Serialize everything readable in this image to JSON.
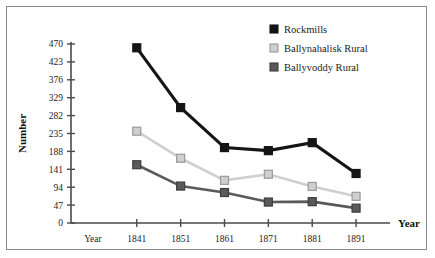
{
  "figure": {
    "frame_border_color": "#8a8a8a",
    "background_color": "#ffffff"
  },
  "chart_data": {
    "type": "line",
    "title": "",
    "xlabel": "Year",
    "ylabel": "Number",
    "categories": [
      "Year",
      "1841",
      "1851",
      "1861",
      "1871",
      "1881",
      "1891"
    ],
    "x_tick_labels": [
      "Year",
      "1841",
      "1851",
      "1861",
      "1871",
      "1881",
      "1891"
    ],
    "y_tick_labels": [
      "0",
      "47",
      "94",
      "141",
      "188",
      "235",
      "282",
      "329",
      "376",
      "423",
      "470"
    ],
    "y_ticks": [
      0,
      47,
      94,
      141,
      188,
      235,
      282,
      329,
      376,
      423,
      470
    ],
    "ylim": [
      0,
      470
    ],
    "grid": false,
    "legend_position": "top-right",
    "marker": "square",
    "series": [
      {
        "name": "Rockmills",
        "color": "#151515",
        "marker_fill": "#151515",
        "marker_edge": "#151515",
        "x": [
          "1841",
          "1851",
          "1861",
          "1871",
          "1881",
          "1891"
        ],
        "values": [
          460,
          303,
          198,
          190,
          211,
          130
        ]
      },
      {
        "name": "Ballynahalisk Rural",
        "color": "#cfcfcf",
        "marker_fill": "#cfcfcf",
        "marker_edge": "#9a9a9a",
        "x": [
          "1841",
          "1851",
          "1861",
          "1871",
          "1881",
          "1891"
        ],
        "values": [
          241,
          170,
          112,
          128,
          96,
          70
        ]
      },
      {
        "name": "Ballyvoddy Rural",
        "color": "#5a5a5a",
        "marker_fill": "#5a5a5a",
        "marker_edge": "#3d3d3d",
        "x": [
          "1841",
          "1851",
          "1861",
          "1871",
          "1881",
          "1891"
        ],
        "values": [
          153,
          97,
          80,
          55,
          56,
          39
        ]
      }
    ],
    "legend": [
      {
        "label": "Rockmills",
        "color": "#151515",
        "edge": "#151515"
      },
      {
        "label": "Ballynahalisk Rural",
        "color": "#cfcfcf",
        "edge": "#9a9a9a"
      },
      {
        "label": "Ballyvoddy Rural",
        "color": "#5a5a5a",
        "edge": "#3d3d3d"
      }
    ]
  }
}
